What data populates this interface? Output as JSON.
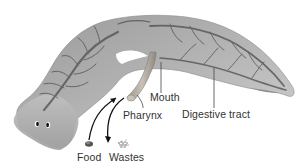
{
  "diagram": {
    "labels": {
      "mouth": "Mouth",
      "pharynx": "Pharynx",
      "digestive_tract": "Digestive tract",
      "food": "Food",
      "wastes": "Wastes"
    },
    "colors": {
      "background": "#ffffff",
      "body_light": "#c9c9c9",
      "body_mid": "#a8a8a8",
      "body_dark": "#5e5e5e",
      "branch": "#4a4a4a",
      "pharynx": "#b5b0aa",
      "text": "#333333",
      "leader_line": "#444444",
      "arrow": "#111111"
    }
  }
}
